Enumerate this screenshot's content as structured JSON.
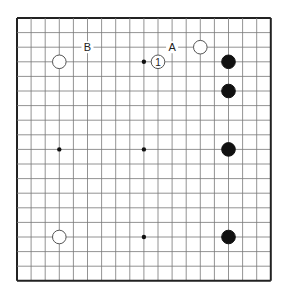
{
  "board": {
    "size": 19,
    "origin": {
      "x": 17,
      "y": 18
    },
    "spacing": {
      "x": 14.1,
      "y": 14.6
    },
    "line_color": "#777777",
    "border_color": "#222222",
    "star_points": [
      [
        3,
        3
      ],
      [
        9,
        3
      ],
      [
        15,
        3
      ],
      [
        3,
        9
      ],
      [
        9,
        9
      ],
      [
        15,
        9
      ],
      [
        3,
        15
      ],
      [
        9,
        15
      ],
      [
        15,
        15
      ]
    ]
  },
  "stones": [
    {
      "color": "white",
      "col": 3,
      "row": 3
    },
    {
      "color": "white",
      "col": 3,
      "row": 15
    },
    {
      "color": "white",
      "col": 13,
      "row": 2
    },
    {
      "color": "white",
      "col": 10,
      "row": 3,
      "label": "1"
    },
    {
      "color": "black",
      "col": 15,
      "row": 3
    },
    {
      "color": "black",
      "col": 15,
      "row": 5
    },
    {
      "color": "black",
      "col": 15,
      "row": 9
    },
    {
      "color": "black",
      "col": 15,
      "row": 15
    }
  ],
  "labels": [
    {
      "text": "B",
      "col": 5,
      "row": 2
    },
    {
      "text": "A",
      "col": 11,
      "row": 2
    }
  ]
}
